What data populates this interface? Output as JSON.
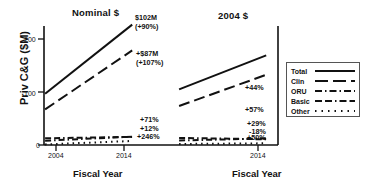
{
  "axes": {
    "ylabel": "Priv C&G ($M)",
    "yticks": [
      "200",
      "100",
      "0"
    ],
    "xlabel_left": "Fiscal Year",
    "xlabel_right": "Fiscal Year",
    "xticks_left": [
      "2004",
      "2014"
    ],
    "xticks_right": [
      "2014"
    ]
  },
  "panels": {
    "left_title": "Nominal $",
    "right_title": "2004 $"
  },
  "legend": {
    "items": [
      {
        "label": "Total",
        "style": "solid"
      },
      {
        "label": "Clin",
        "style": "longdash"
      },
      {
        "label": "ORU",
        "style": "dashdot"
      },
      {
        "label": "Basic",
        "style": "dashdashdot"
      },
      {
        "label": "Other",
        "style": "dotted"
      }
    ]
  },
  "annotations": {
    "left": {
      "total": "$102M",
      "total_pct": "(+90%)",
      "clin": "+$87M",
      "clin_pct": "(+107%)",
      "oru": "+71%",
      "basic": "+12%",
      "other": "+246%"
    },
    "right": {
      "total": "+44%",
      "clin": "+57%",
      "oru": "+29%",
      "basic": "-18%",
      "other": "+50%"
    }
  },
  "chart_data": {
    "type": "line",
    "xlabel": "Fiscal Year",
    "ylabel": "Priv C&G ($M)",
    "ylim": [
      0,
      230
    ],
    "yticks": [
      0,
      100,
      200
    ],
    "grid": false,
    "legend_position": "right",
    "panels": [
      {
        "name": "Nominal $",
        "x": [
          2004,
          2014
        ],
        "xlim": [
          2003.2,
          2014.8
        ],
        "series": [
          {
            "name": "Total",
            "style": "solid",
            "values": [
              113,
              215
            ],
            "label": "$102M (+90%)"
          },
          {
            "name": "Clin",
            "style": "longdash",
            "values": [
              81,
              168
            ],
            "label": "+$87M (+107%)"
          },
          {
            "name": "ORU",
            "style": "dashdot",
            "values": [
              9,
              15
            ],
            "label": "+71%"
          },
          {
            "name": "Basic",
            "style": "dashdashdot",
            "values": [
              13,
              15
            ],
            "label": "+12%"
          },
          {
            "name": "Other",
            "style": "dotted",
            "values": [
              2,
              7
            ],
            "label": "+246%"
          }
        ]
      },
      {
        "name": "2004 $",
        "x": [
          2004,
          2014
        ],
        "xlim": [
          2003.2,
          2014.8
        ],
        "series": [
          {
            "name": "Total",
            "style": "solid",
            "values": [
              113,
              163
            ],
            "label": "+44%"
          },
          {
            "name": "Clin",
            "style": "longdash",
            "values": [
              81,
              127
            ],
            "label": "+57%"
          },
          {
            "name": "ORU",
            "style": "dashdot",
            "values": [
              9,
              12
            ],
            "label": "+29%"
          },
          {
            "name": "Basic",
            "style": "dashdashdot",
            "values": [
              13,
              11
            ],
            "label": "-18%"
          },
          {
            "name": "Other",
            "style": "dotted",
            "values": [
              2,
              3
            ],
            "label": "+50%"
          }
        ]
      }
    ]
  }
}
